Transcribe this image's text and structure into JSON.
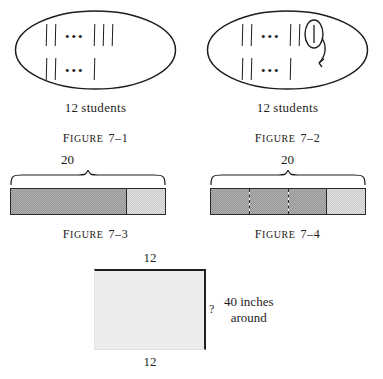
{
  "figures": [
    {
      "id": "figure-7-1",
      "caption_prefix": "F",
      "caption_small": "IGURE",
      "caption_number": "7–1",
      "label": "12 students",
      "label_number": "12",
      "label_word": "students",
      "rows": [
        {
          "left_marks": 2,
          "dots": "•••",
          "right_marks": 3,
          "circled": false
        },
        {
          "left_marks": 2,
          "dots": "•••",
          "right_marks": 1,
          "circled": false
        }
      ],
      "has_circled_mark": false,
      "has_arrow": false
    },
    {
      "id": "figure-7-2",
      "caption_prefix": "F",
      "caption_small": "IGURE",
      "caption_number": "7–2",
      "label": "12 students",
      "label_number": "12",
      "label_word": "students",
      "rows": [
        {
          "left_marks": 2,
          "dots": "•••",
          "right_marks": 2,
          "circled": true
        },
        {
          "left_marks": 2,
          "dots": "•••",
          "right_marks": 1,
          "circled": false
        }
      ],
      "has_circled_mark": true,
      "has_arrow": true
    },
    {
      "id": "figure-7-3",
      "caption_prefix": "F",
      "caption_small": "IGURE",
      "caption_number": "7–3",
      "brace_label": "20",
      "total": 20,
      "dark_units": 15,
      "light_units": 5,
      "dashed_divisions": 0
    },
    {
      "id": "figure-7-4",
      "caption_prefix": "F",
      "caption_small": "IGURE",
      "caption_number": "7–4",
      "brace_label": "20",
      "total": 20,
      "dark_units": 15,
      "light_units": 5,
      "dashed_divisions": 2
    }
  ],
  "bottom_figure": {
    "id": "perimeter-rectangle",
    "top_label": "12",
    "bottom_label": "12",
    "side_label": "?",
    "note_line1": "40  inches",
    "note_line2": "around"
  },
  "colors": {
    "ink": "#1d1d1d",
    "dark_fill": "#b3b3b3",
    "light_fill": "#e2e2e2",
    "rect_fill": "#ececec",
    "page": "#ffffff"
  }
}
